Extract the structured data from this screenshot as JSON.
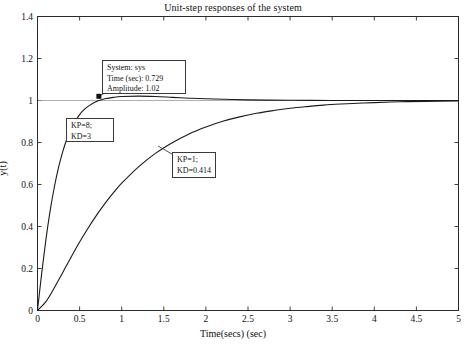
{
  "chart_data": {
    "type": "line",
    "title": "Unit-step responses of the system",
    "xlabel": "Time(secs) (sec)",
    "ylabel": "y(t)",
    "xlim": [
      0,
      5
    ],
    "ylim": [
      0,
      1.4
    ],
    "grid": false,
    "legend_position": "none",
    "xticks": [
      "0",
      "0.5",
      "1",
      "1.5",
      "2",
      "2.5",
      "3",
      "3.5",
      "4",
      "4.5",
      "5"
    ],
    "xtick_values": [
      0,
      0.5,
      1,
      1.5,
      2,
      2.5,
      3,
      3.5,
      4,
      4.5,
      5
    ],
    "yticks": [
      "0",
      "0.2",
      "0.4",
      "0.6",
      "0.8",
      "1",
      "1.2",
      "1.4"
    ],
    "ytick_values": [
      0,
      0.2,
      0.4,
      0.6,
      0.8,
      1,
      1.2,
      1.4
    ],
    "reference_line": {
      "y": 1,
      "label": "steady-state"
    },
    "series": [
      {
        "name": "KP=8; KD=3",
        "color": "#1a1a1a",
        "x": [
          0,
          0.05,
          0.1,
          0.15,
          0.2,
          0.25,
          0.3,
          0.35,
          0.4,
          0.45,
          0.5,
          0.55,
          0.6,
          0.65,
          0.7,
          0.729,
          0.8,
          0.9,
          1.0,
          1.2,
          1.4,
          1.6,
          1.8,
          2.0,
          2.5,
          3.0,
          3.5,
          4.0,
          4.5,
          5.0
        ],
        "y": [
          0,
          0.178,
          0.338,
          0.474,
          0.588,
          0.681,
          0.757,
          0.818,
          0.866,
          0.903,
          0.933,
          0.955,
          0.972,
          0.985,
          0.995,
          1.0,
          1.008,
          1.015,
          1.019,
          1.021,
          1.019,
          1.015,
          1.011,
          1.008,
          1.003,
          1.001,
          1.0,
          1.0,
          1.0,
          1.0
        ]
      },
      {
        "name": "KP=1; KD=0.414",
        "color": "#1a1a1a",
        "x": [
          0,
          0.1,
          0.2,
          0.3,
          0.4,
          0.5,
          0.6,
          0.7,
          0.8,
          0.9,
          1.0,
          1.2,
          1.4,
          1.6,
          1.8,
          2.0,
          2.2,
          2.4,
          2.6,
          2.8,
          3.0,
          3.2,
          3.4,
          3.6,
          3.8,
          4.0,
          4.3,
          4.6,
          5.0
        ],
        "y": [
          0,
          0.042,
          0.108,
          0.181,
          0.255,
          0.326,
          0.392,
          0.453,
          0.509,
          0.56,
          0.606,
          0.684,
          0.748,
          0.799,
          0.841,
          0.874,
          0.901,
          0.922,
          0.939,
          0.952,
          0.963,
          0.971,
          0.978,
          0.983,
          0.987,
          0.99,
          0.994,
          0.996,
          0.998
        ]
      }
    ],
    "marker_point": {
      "x": 0.729,
      "y": 1.02
    }
  },
  "annotations": {
    "datatip": {
      "line1": "System: sys",
      "line2": "Time (sec): 0.729",
      "line3": "Amplitude: 1.02"
    },
    "fast_label": {
      "line1": "KP=8;",
      "line2": "KD=3"
    },
    "slow_label": {
      "line1": "KP=1;",
      "line2": "KD=0.414"
    }
  }
}
